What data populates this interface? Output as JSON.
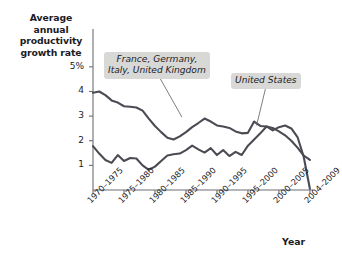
{
  "figure": {
    "background_color": "#ffffff",
    "line_color": "#4b4b53",
    "axis_color": "#6f6f75",
    "annotation_background": "#d8d8d6"
  },
  "annotations": {
    "europe": "France, Germany,\nItaly, United Kingdom",
    "united_states": "United States"
  },
  "chart_data": {
    "type": "line",
    "title": "",
    "subtitle": "",
    "xlabel": "Year",
    "ylabel": "Average annual\nproductivity\ngrowth rate",
    "ylabel_line1": "Average annual",
    "ylabel_line2": "productivity",
    "ylabel_line3": "growth rate",
    "grid": false,
    "legend_position": "inline-annotations",
    "ylim": [
      0,
      5.4
    ],
    "ytick_values": [
      1,
      2,
      3,
      4,
      5
    ],
    "ytick_labels": [
      "1",
      "2",
      "3",
      "4",
      "5%"
    ],
    "categories": [
      "1970–1975",
      "1975–1980",
      "1980–1985",
      "1985–1990",
      "1990–1995",
      "1995–2000",
      "2000–2005",
      "2004–2009"
    ],
    "xtick_positions": [
      0,
      1,
      2,
      3,
      4,
      5,
      6,
      7
    ],
    "xlim": [
      0,
      7.1
    ],
    "series": [
      {
        "name": "France, Germany, Italy, United Kingdom",
        "color": "#4b4b53",
        "x": [
          0.0,
          0.2,
          0.4,
          0.62,
          0.8,
          1.0,
          1.2,
          1.4,
          1.6,
          1.8,
          2.0,
          2.2,
          2.4,
          2.6,
          2.8,
          3.0,
          3.2,
          3.4,
          3.6,
          3.8,
          4.0,
          4.2,
          4.4,
          4.6,
          4.8,
          5.0,
          5.2,
          5.4,
          5.6,
          5.8,
          6.0,
          6.2,
          6.4,
          6.6,
          6.8,
          7.0
        ],
        "y": [
          3.95,
          4.0,
          3.85,
          3.62,
          3.55,
          3.4,
          3.38,
          3.35,
          3.22,
          2.9,
          2.6,
          2.35,
          2.12,
          2.05,
          2.18,
          2.35,
          2.55,
          2.72,
          2.9,
          2.78,
          2.62,
          2.58,
          2.52,
          2.38,
          2.3,
          2.32,
          2.78,
          2.6,
          2.58,
          2.52,
          2.38,
          2.22,
          2.0,
          1.72,
          1.4,
          1.22
        ]
      },
      {
        "name": "United States",
        "color": "#4b4b53",
        "x": [
          0.0,
          0.2,
          0.4,
          0.6,
          0.8,
          1.0,
          1.2,
          1.4,
          1.6,
          1.8,
          2.0,
          2.2,
          2.4,
          2.6,
          2.8,
          3.0,
          3.2,
          3.4,
          3.6,
          3.8,
          4.0,
          4.2,
          4.4,
          4.6,
          4.8,
          5.0,
          5.2,
          5.4,
          5.6,
          5.8,
          6.0,
          6.2,
          6.4,
          6.6,
          6.8,
          7.0
        ],
        "y": [
          1.78,
          1.48,
          1.22,
          1.1,
          1.42,
          1.18,
          1.3,
          1.28,
          1.0,
          0.82,
          0.95,
          1.18,
          1.4,
          1.45,
          1.48,
          1.62,
          1.8,
          1.65,
          1.52,
          1.7,
          1.42,
          1.62,
          1.38,
          1.55,
          1.42,
          1.8,
          2.05,
          2.3,
          2.58,
          2.42,
          2.55,
          2.62,
          2.5,
          2.15,
          1.35,
          0.05
        ]
      }
    ],
    "leader_lines": [
      {
        "name": "europe-leader",
        "from": [
          2.08,
          4.72
        ],
        "to": [
          2.87,
          2.96
        ]
      },
      {
        "name": "us-leader",
        "from": [
          5.62,
          4.4
        ],
        "to": [
          5.28,
          2.62
        ]
      }
    ]
  }
}
